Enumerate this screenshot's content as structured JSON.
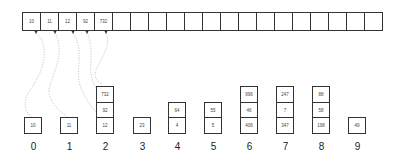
{
  "diagram": {
    "type": "radix-sort-buckets",
    "array": {
      "cells": [
        "10",
        "11",
        "12",
        "92",
        "732",
        "",
        "",
        "",
        "",
        "",
        "",
        "",
        "",
        "",
        "",
        "",
        "",
        "",
        "",
        ""
      ]
    },
    "buckets": [
      {
        "label": "0",
        "items": [
          "10"
        ]
      },
      {
        "label": "1",
        "items": [
          "11"
        ]
      },
      {
        "label": "2",
        "items": [
          "12",
          "92",
          "732"
        ]
      },
      {
        "label": "3",
        "items": [
          "23"
        ]
      },
      {
        "label": "4",
        "items": [
          "4",
          "64"
        ]
      },
      {
        "label": "5",
        "items": [
          "5",
          "55"
        ]
      },
      {
        "label": "6",
        "items": [
          "406",
          "46",
          "996"
        ]
      },
      {
        "label": "7",
        "items": [
          "347",
          "7",
          "247"
        ]
      },
      {
        "label": "8",
        "items": [
          "198",
          "58",
          "88"
        ]
      },
      {
        "label": "9",
        "items": [
          "49"
        ]
      }
    ]
  }
}
